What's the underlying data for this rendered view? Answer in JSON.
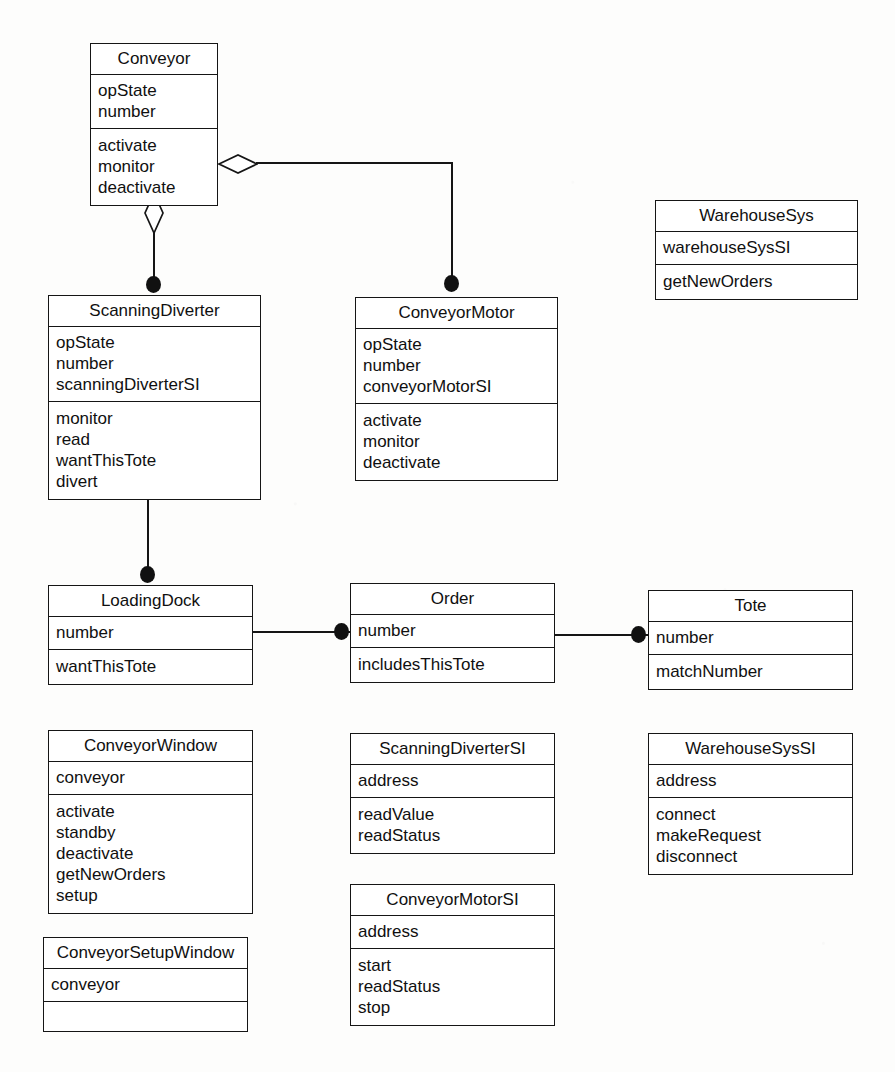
{
  "diagram": {
    "kind": "uml-class-diagram",
    "background_color": "#fdfdfc",
    "line_color": "#151515",
    "fill_color": "#ffffff"
  },
  "classes": [
    {
      "id": "conveyor",
      "name": "Conveyor",
      "attributes": [
        "opState",
        "number"
      ],
      "operations": [
        "activate",
        "monitor",
        "deactivate"
      ],
      "x": 90,
      "y": 43,
      "w": 128,
      "name_h": 31,
      "attr_h": 49,
      "op_h": 69
    },
    {
      "id": "warehouse-sys",
      "name": "WarehouseSys",
      "attributes": [
        "warehouseSysSI"
      ],
      "operations": [
        "getNewOrders"
      ],
      "x": 655,
      "y": 200,
      "w": 203,
      "name_h": 31,
      "attr_h": 33,
      "op_h": 33
    },
    {
      "id": "scanning-diverter",
      "name": "ScanningDiverter",
      "attributes": [
        "opState",
        "number",
        "scanningDiverterSI"
      ],
      "operations": [
        "monitor",
        "read",
        "wantThisTote",
        "divert"
      ],
      "x": 48,
      "y": 295,
      "w": 213,
      "name_h": 31,
      "attr_h": 71,
      "op_h": 90
    },
    {
      "id": "conveyor-motor",
      "name": "ConveyorMotor",
      "attributes": [
        "opState",
        "number",
        "conveyorMotorSI"
      ],
      "operations": [
        "activate",
        "monitor",
        "deactivate"
      ],
      "x": 355,
      "y": 297,
      "w": 203,
      "name_h": 31,
      "attr_h": 71,
      "op_h": 77
    },
    {
      "id": "loading-dock",
      "name": "LoadingDock",
      "attributes": [
        "number"
      ],
      "operations": [
        "wantThisTote"
      ],
      "x": 48,
      "y": 585,
      "w": 205,
      "name_h": 31,
      "attr_h": 33,
      "op_h": 33
    },
    {
      "id": "order",
      "name": "Order",
      "attributes": [
        "number"
      ],
      "operations": [
        "includesThisTote"
      ],
      "x": 350,
      "y": 583,
      "w": 205,
      "name_h": 31,
      "attr_h": 33,
      "op_h": 35
    },
    {
      "id": "tote",
      "name": "Tote",
      "attributes": [
        "number"
      ],
      "operations": [
        "matchNumber"
      ],
      "x": 648,
      "y": 590,
      "w": 205,
      "name_h": 31,
      "attr_h": 33,
      "op_h": 35
    },
    {
      "id": "conveyor-window",
      "name": "ConveyorWindow",
      "attributes": [
        "conveyor"
      ],
      "operations": [
        "activate",
        "standby",
        "deactivate",
        "getNewOrders",
        "setup"
      ],
      "x": 48,
      "y": 730,
      "w": 205,
      "name_h": 31,
      "attr_h": 33,
      "op_h": 112
    },
    {
      "id": "conveyor-setup-window",
      "name": "ConveyorSetupWindow",
      "attributes": [
        "conveyor"
      ],
      "operations": [],
      "x": 43,
      "y": 937,
      "w": 205,
      "name_h": 31,
      "attr_h": 33,
      "op_h": 36
    },
    {
      "id": "scanning-diverter-si",
      "name": "ScanningDiverterSI",
      "attributes": [
        "address"
      ],
      "operations": [
        "readValue",
        "readStatus"
      ],
      "x": 350,
      "y": 733,
      "w": 205,
      "name_h": 31,
      "attr_h": 33,
      "op_h": 56
    },
    {
      "id": "conveyor-motor-si",
      "name": "ConveyorMotorSI",
      "attributes": [
        "address"
      ],
      "operations": [
        "start",
        "readStatus",
        "stop"
      ],
      "x": 350,
      "y": 884,
      "w": 205,
      "name_h": 31,
      "attr_h": 33,
      "op_h": 77
    },
    {
      "id": "warehouse-sys-si",
      "name": "WarehouseSysSI",
      "attributes": [
        "address"
      ],
      "operations": [
        "connect",
        "makeRequest",
        "disconnect"
      ],
      "x": 648,
      "y": 733,
      "w": 205,
      "name_h": 31,
      "attr_h": 33,
      "op_h": 77
    }
  ],
  "relationships": [
    {
      "id": "conveyor-scanning-diverter",
      "from": "Conveyor",
      "to": "ScanningDiverter",
      "type": "aggregation",
      "from_marker": "hollow-diamond",
      "to_marker": "filled-circle"
    },
    {
      "id": "conveyor-conveyor-motor",
      "from": "Conveyor",
      "to": "ConveyorMotor",
      "type": "aggregation",
      "from_marker": "hollow-diamond",
      "to_marker": "filled-circle"
    },
    {
      "id": "scanning-diverter-loading-dock",
      "from": "ScanningDiverter",
      "to": "LoadingDock",
      "type": "association",
      "from_marker": "none",
      "to_marker": "filled-circle"
    },
    {
      "id": "loading-dock-order",
      "from": "LoadingDock",
      "to": "Order",
      "type": "association",
      "from_marker": "none",
      "to_marker": "filled-circle"
    },
    {
      "id": "order-tote",
      "from": "Order",
      "to": "Tote",
      "type": "association",
      "from_marker": "none",
      "to_marker": "filled-circle"
    }
  ]
}
